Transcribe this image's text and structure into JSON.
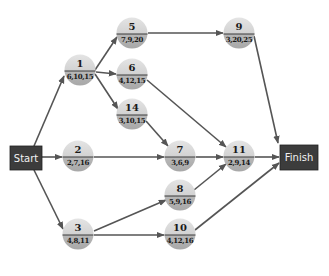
{
  "diagram": {
    "type": "activity-on-node network",
    "colors": {
      "node_top": "#dcdcdc",
      "node_bottom": "#b4b4b4",
      "node_divider": "#3a3a3a",
      "edge": "#555555",
      "terminal_fill": "#3c3c3c",
      "terminal_text": "#f2f2f2"
    },
    "terminals": {
      "start": {
        "label": "Start"
      },
      "finish": {
        "label": "Finish"
      }
    },
    "nodes": {
      "n1": {
        "id": "1",
        "values": "6,10,15"
      },
      "n2": {
        "id": "2",
        "values": "2,7,16"
      },
      "n3": {
        "id": "3",
        "values": "4,8,11"
      },
      "n5": {
        "id": "5",
        "values": "7,9,20"
      },
      "n6": {
        "id": "6",
        "values": "4,12,15"
      },
      "n7": {
        "id": "7",
        "values": "3,6,9"
      },
      "n8": {
        "id": "8",
        "values": "5,9,16"
      },
      "n9": {
        "id": "9",
        "values": "3,20,25"
      },
      "n10": {
        "id": "10",
        "values": "4,12,16"
      },
      "n11": {
        "id": "11",
        "values": "2,9,14"
      },
      "n14": {
        "id": "14",
        "values": "3,10,15"
      }
    },
    "edges": [
      [
        "Start",
        "1"
      ],
      [
        "Start",
        "2"
      ],
      [
        "Start",
        "3"
      ],
      [
        "1",
        "5"
      ],
      [
        "1",
        "6"
      ],
      [
        "1",
        "14"
      ],
      [
        "5",
        "9"
      ],
      [
        "6",
        "11"
      ],
      [
        "14",
        "7"
      ],
      [
        "2",
        "7"
      ],
      [
        "7",
        "11"
      ],
      [
        "3",
        "8"
      ],
      [
        "3",
        "10"
      ],
      [
        "8",
        "11"
      ],
      [
        "9",
        "Finish"
      ],
      [
        "11",
        "Finish"
      ],
      [
        "10",
        "Finish"
      ]
    ]
  }
}
